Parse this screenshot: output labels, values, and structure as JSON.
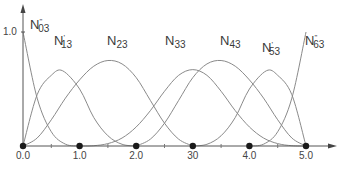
{
  "chart_data": {
    "type": "line",
    "title": "",
    "xlabel": "",
    "ylabel": "",
    "xlim": [
      0,
      5
    ],
    "ylim": [
      0,
      1.0
    ],
    "grid": false,
    "x_ticks": [
      "0.0",
      "1.0",
      "2.0",
      "30",
      "4.0",
      "5.0"
    ],
    "x_tick_values": [
      0,
      1,
      2,
      3,
      4,
      5
    ],
    "y_ticks": [
      "1.0"
    ],
    "knot_markers": [
      0,
      1,
      2,
      3,
      4,
      5
    ],
    "series": [
      {
        "name": "N03",
        "label_main": "N",
        "label_sub": "03",
        "label_mark": "\"",
        "label_pos": [
          30,
          17
        ],
        "points": [
          [
            0,
            1.0
          ],
          [
            0.25,
            0.42
          ],
          [
            0.5,
            0.125
          ],
          [
            0.75,
            0.016
          ],
          [
            1,
            0
          ]
        ]
      },
      {
        "name": "N13",
        "label_main": "N",
        "label_sub": "13",
        "label_mark": "'",
        "label_pos": [
          54,
          33
        ],
        "points": [
          [
            0,
            0
          ],
          [
            0.25,
            0.45
          ],
          [
            0.5,
            0.62
          ],
          [
            0.7,
            0.66
          ],
          [
            1,
            0.5
          ],
          [
            1.25,
            0.25
          ],
          [
            1.5,
            0.09
          ],
          [
            1.75,
            0.015
          ],
          [
            2,
            0
          ]
        ]
      },
      {
        "name": "N23",
        "label_main": "N",
        "label_sub": "23",
        "label_mark": "",
        "label_pos": [
          107,
          33
        ],
        "points": [
          [
            0,
            0
          ],
          [
            0.25,
            0.07
          ],
          [
            0.5,
            0.23
          ],
          [
            0.75,
            0.42
          ],
          [
            1,
            0.58
          ],
          [
            1.25,
            0.7
          ],
          [
            1.5,
            0.75
          ],
          [
            1.75,
            0.72
          ],
          [
            2,
            0.6
          ],
          [
            2.25,
            0.4
          ],
          [
            2.5,
            0.2
          ],
          [
            2.75,
            0.06
          ],
          [
            3,
            0
          ]
        ]
      },
      {
        "name": "N33",
        "label_main": "N",
        "label_sub": "33",
        "label_mark": "",
        "label_pos": [
          165,
          33
        ],
        "points": [
          [
            1,
            0
          ],
          [
            1.25,
            0.0026
          ],
          [
            1.5,
            0.021
          ],
          [
            1.75,
            0.07
          ],
          [
            2,
            0.167
          ],
          [
            2.25,
            0.31
          ],
          [
            2.5,
            0.48
          ],
          [
            2.75,
            0.62
          ],
          [
            3,
            0.67
          ],
          [
            3.25,
            0.62
          ],
          [
            3.5,
            0.48
          ],
          [
            3.75,
            0.31
          ],
          [
            4,
            0.167
          ],
          [
            4.25,
            0.07
          ],
          [
            4.5,
            0.021
          ],
          [
            4.75,
            0.0026
          ],
          [
            5,
            0
          ]
        ]
      },
      {
        "name": "N43",
        "label_main": "N",
        "label_sub": "43",
        "label_mark": "",
        "label_pos": [
          220,
          33
        ],
        "points": [
          [
            2,
            0
          ],
          [
            2.25,
            0.06
          ],
          [
            2.5,
            0.2
          ],
          [
            2.75,
            0.4
          ],
          [
            3,
            0.6
          ],
          [
            3.25,
            0.72
          ],
          [
            3.5,
            0.75
          ],
          [
            3.75,
            0.7
          ],
          [
            4,
            0.58
          ],
          [
            4.25,
            0.42
          ],
          [
            4.5,
            0.23
          ],
          [
            4.75,
            0.07
          ],
          [
            5,
            0
          ]
        ]
      },
      {
        "name": "N53",
        "label_main": "N",
        "label_sub": "53",
        "label_mark": "'",
        "label_pos": [
          262,
          40
        ],
        "points": [
          [
            3,
            0
          ],
          [
            3.25,
            0.015
          ],
          [
            3.5,
            0.09
          ],
          [
            3.75,
            0.25
          ],
          [
            4,
            0.5
          ],
          [
            4.3,
            0.66
          ],
          [
            4.5,
            0.62
          ],
          [
            4.75,
            0.45
          ],
          [
            5,
            0
          ]
        ]
      },
      {
        "name": "N63",
        "label_main": "N",
        "label_sub": "63",
        "label_mark": "\"",
        "label_pos": [
          305,
          33
        ],
        "points": [
          [
            4,
            0
          ],
          [
            4.25,
            0.016
          ],
          [
            4.5,
            0.125
          ],
          [
            4.75,
            0.42
          ],
          [
            5,
            1.0
          ]
        ]
      }
    ],
    "colors": {
      "curve": "#8a8a8a",
      "axis": "#555555",
      "marker": "#1a1a1a",
      "text": "#3a3a3a"
    },
    "plot_px": {
      "x0": 23,
      "x1": 306,
      "y0": 146,
      "y1": 32
    }
  }
}
